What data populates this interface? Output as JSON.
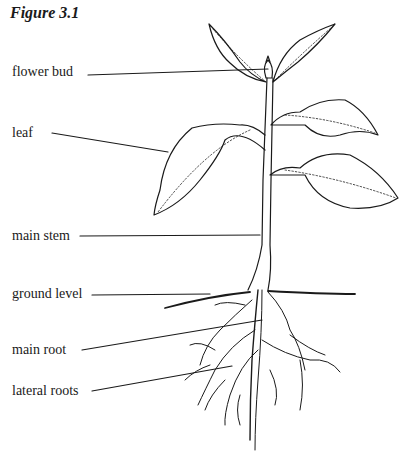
{
  "figure": {
    "title": "Figure 3.1",
    "labels": [
      {
        "id": "flower-bud",
        "text": "flower bud"
      },
      {
        "id": "leaf",
        "text": "leaf"
      },
      {
        "id": "main-stem",
        "text": "main stem"
      },
      {
        "id": "ground-level",
        "text": "ground level"
      },
      {
        "id": "main-root",
        "text": "main root"
      },
      {
        "id": "lateral-roots",
        "text": "lateral roots"
      }
    ]
  }
}
